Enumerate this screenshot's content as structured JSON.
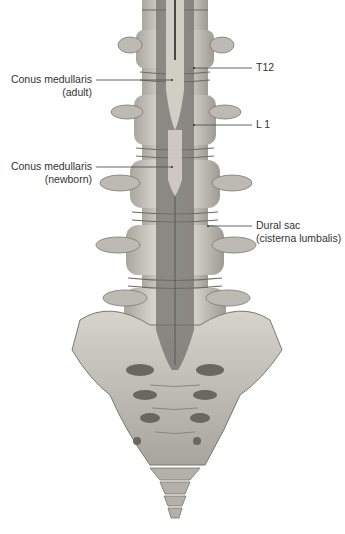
{
  "figure": {
    "colors": {
      "bone": "#c9c6c0",
      "bone_shadow": "#8f8b85",
      "bone_dark": "#5e5a55",
      "dural_sac": "#6f6c68",
      "cord": "#4a4744",
      "background": "#ffffff",
      "leader_line": "#555555"
    }
  },
  "labels": {
    "conus_adult": {
      "line1": "Conus medullaris",
      "line2": "(adult)"
    },
    "conus_newborn": {
      "line1": "Conus medullaris",
      "line2": "(newborn)"
    },
    "t12": {
      "text": "T12"
    },
    "l1": {
      "text": "L 1"
    },
    "dural_sac": {
      "line1": "Dural sac",
      "line2": "(cisterna lumbalis)"
    }
  }
}
